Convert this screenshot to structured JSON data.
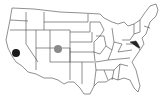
{
  "map": {
    "type": "choropleth-outline",
    "region": "United States (contiguous)",
    "outline_color": "#444444",
    "fill_color": "#ffffff",
    "markers": [
      {
        "name": "california-marker",
        "state": "California",
        "color": "#1a1a1a",
        "x": 16,
        "y": 53,
        "r": 4
      },
      {
        "name": "colorado-marker",
        "state": "Colorado",
        "color": "#8a8a8a",
        "x": 58,
        "y": 49,
        "r": 4
      }
    ],
    "highlighted": [
      {
        "state": "Maryland",
        "color": "#222222"
      }
    ]
  }
}
